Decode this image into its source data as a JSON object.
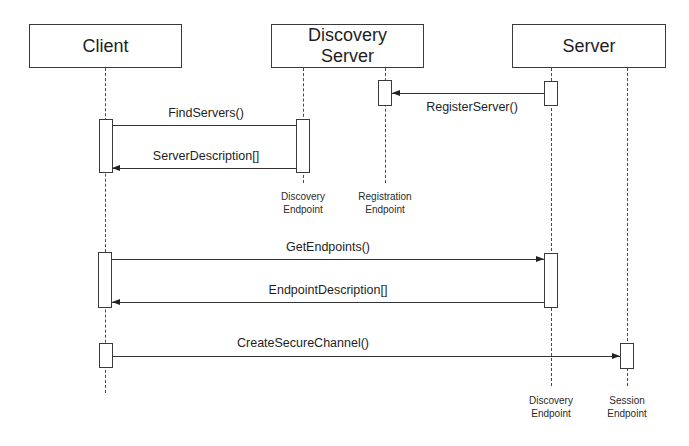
{
  "diagram": {
    "type": "sequence",
    "participants": [
      {
        "id": "client",
        "label": "Client"
      },
      {
        "id": "discovery_server",
        "label": "Discovery\nServer"
      },
      {
        "id": "server",
        "label": "Server"
      }
    ],
    "endpoints": [
      {
        "id": "client_line",
        "owner": "client",
        "label": ""
      },
      {
        "id": "ds_discovery_endpoint",
        "owner": "discovery_server",
        "label": "Discovery\nEndpoint"
      },
      {
        "id": "ds_registration_endpoint",
        "owner": "discovery_server",
        "label": "Registration\nEndpoint"
      },
      {
        "id": "server_discovery_endpoint",
        "owner": "server",
        "label": "Discovery\nEndpoint"
      },
      {
        "id": "server_session_endpoint",
        "owner": "server",
        "label": "Session\nEndpoint"
      }
    ],
    "messages": [
      {
        "from": "server_discovery_endpoint",
        "to": "ds_registration_endpoint",
        "label": "RegisterServer()",
        "direction": "left"
      },
      {
        "from": "client_line",
        "to": "ds_discovery_endpoint",
        "label": "FindServers()",
        "direction": "right"
      },
      {
        "from": "ds_discovery_endpoint",
        "to": "client_line",
        "label": "ServerDescription[]",
        "direction": "left"
      },
      {
        "from": "client_line",
        "to": "server_discovery_endpoint",
        "label": "GetEndpoints()",
        "direction": "right"
      },
      {
        "from": "server_discovery_endpoint",
        "to": "client_line",
        "label": "EndpointDescription[]",
        "direction": "left"
      },
      {
        "from": "client_line",
        "to": "server_session_endpoint",
        "label": "CreateSecureChannel()",
        "direction": "right"
      }
    ]
  },
  "colors": {
    "background": "#ffffff",
    "line": "#333333",
    "text": "#1e1e1e"
  }
}
